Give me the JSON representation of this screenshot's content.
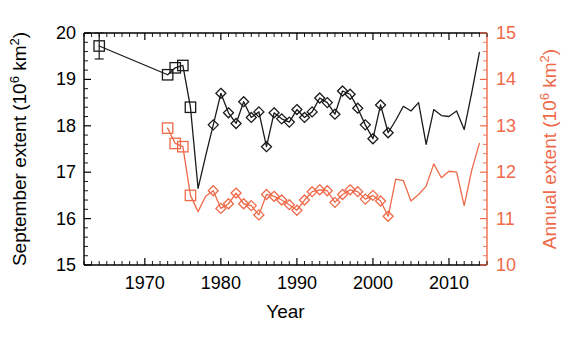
{
  "chart_data": {
    "type": "line",
    "title": "",
    "xlabel": "Year",
    "ylabel": "September extent (10⁶ km²)",
    "ylabel_right": "Annual extent (10⁶ km²)",
    "xlim": [
      1962,
      2015
    ],
    "ylim": [
      15,
      20
    ],
    "ylim_right": [
      10,
      15
    ],
    "xticks": [
      1970,
      1980,
      1990,
      2000,
      2010
    ],
    "xticklabels": [
      "1970",
      "1980",
      "1990",
      "2000",
      "2010"
    ],
    "yticks": [
      15,
      16,
      17,
      18,
      19,
      20
    ],
    "yticklabels": [
      "15",
      "16",
      "17",
      "18",
      "19",
      "20"
    ],
    "yticks_right": [
      10,
      11,
      12,
      13,
      14,
      15
    ],
    "yticklabels_right": [
      "10",
      "11",
      "12",
      "13",
      "14",
      "15"
    ],
    "minor_ticks_per_interval": 5,
    "grid": false,
    "legend": "none",
    "colors": {
      "september": "#1a1a1a",
      "annual": "#ef6a4a",
      "axis": "#000000",
      "right_axis": "#ef6a4a"
    },
    "series": [
      {
        "name": "September extent",
        "axis": "left",
        "color": "#1a1a1a",
        "marker_square_years": [
          1964,
          1973,
          1974,
          1975,
          1976
        ],
        "marker_diamond_years": [
          1979,
          1980,
          1981,
          1982,
          1983,
          1984,
          1985,
          1986,
          1987,
          1988,
          1989,
          1990,
          1991,
          1992,
          1993,
          1994,
          1995,
          1996,
          1997,
          1998,
          1999,
          2000,
          2001,
          2002
        ],
        "errorbar_years": [
          1964
        ],
        "errorbar_value": 0.28,
        "x": [
          1964,
          1973,
          1974,
          1975,
          1976,
          1977,
          1978,
          1979,
          1980,
          1981,
          1982,
          1983,
          1984,
          1985,
          1986,
          1987,
          1988,
          1989,
          1990,
          1991,
          1992,
          1993,
          1994,
          1995,
          1996,
          1997,
          1998,
          1999,
          2000,
          2001,
          2002,
          2003,
          2004,
          2005,
          2006,
          2007,
          2008,
          2009,
          2010,
          2011,
          2012,
          2013,
          2014
        ],
        "y": [
          19.72,
          19.1,
          19.25,
          19.3,
          18.4,
          16.65,
          17.35,
          18.02,
          18.7,
          18.28,
          18.05,
          18.52,
          18.18,
          18.3,
          17.55,
          18.28,
          18.15,
          18.08,
          18.35,
          18.18,
          18.3,
          18.6,
          18.5,
          18.25,
          18.75,
          18.68,
          18.38,
          18.02,
          17.72,
          18.45,
          17.85,
          18.12,
          18.42,
          18.32,
          18.5,
          17.6,
          18.35,
          18.22,
          18.2,
          18.32,
          17.92,
          18.72,
          19.58
        ]
      },
      {
        "name": "Annual extent",
        "axis": "right",
        "color": "#ef6a4a",
        "marker_square_years": [
          1973,
          1974,
          1975,
          1976
        ],
        "marker_diamond_years": [
          1979,
          1980,
          1981,
          1982,
          1983,
          1984,
          1985,
          1986,
          1987,
          1988,
          1989,
          1990,
          1991,
          1992,
          1993,
          1994,
          1995,
          1996,
          1997,
          1998,
          1999,
          2000,
          2001,
          2002
        ],
        "x": [
          1973,
          1974,
          1975,
          1976,
          1977,
          1978,
          1979,
          1980,
          1981,
          1982,
          1983,
          1984,
          1985,
          1986,
          1987,
          1988,
          1989,
          1990,
          1991,
          1992,
          1993,
          1994,
          1995,
          1996,
          1997,
          1998,
          1999,
          2000,
          2001,
          2002,
          2003,
          2004,
          2005,
          2006,
          2007,
          2008,
          2009,
          2010,
          2011,
          2012,
          2013,
          2014
        ],
        "y": [
          12.95,
          12.62,
          12.55,
          11.5,
          11.15,
          11.48,
          11.6,
          11.22,
          11.32,
          11.55,
          11.32,
          11.28,
          11.08,
          11.52,
          11.48,
          11.4,
          11.3,
          11.18,
          11.4,
          11.58,
          11.62,
          11.6,
          11.35,
          11.52,
          11.62,
          11.58,
          11.42,
          11.5,
          11.38,
          11.05,
          11.85,
          11.82,
          11.38,
          11.52,
          11.7,
          12.18,
          11.88,
          12.02,
          12.0,
          11.28,
          12.05,
          12.62
        ]
      }
    ]
  },
  "axis_text": {
    "left_title": "September extent (10⁶ km²)",
    "right_title": "Annual extent (10⁶ km²)",
    "x_title": "Year"
  }
}
